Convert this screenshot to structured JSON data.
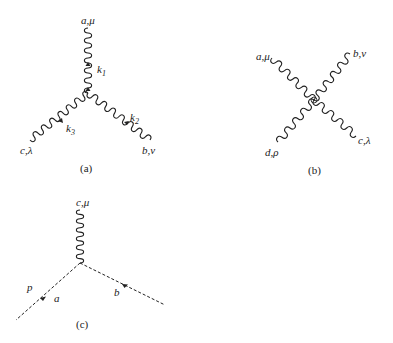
{
  "diagrams": [
    {
      "id": "a",
      "caption": "(a)",
      "legs": [
        {
          "label": "a,μ",
          "momentum": "k",
          "momentum_sub": "1"
        },
        {
          "label": "b,ν",
          "momentum": "k",
          "momentum_sub": "2"
        },
        {
          "label": "c,λ",
          "momentum": "k",
          "momentum_sub": "3"
        }
      ]
    },
    {
      "id": "b",
      "caption": "(b)",
      "legs": [
        {
          "label": "a,μ"
        },
        {
          "label": "b,ν"
        },
        {
          "label": "c,λ"
        },
        {
          "label": "d,ρ"
        }
      ]
    },
    {
      "id": "c",
      "caption": "(c)",
      "gluon_label": "c,μ",
      "ghost_labels": {
        "momentum": "p",
        "left": "a",
        "right": "b"
      }
    }
  ]
}
